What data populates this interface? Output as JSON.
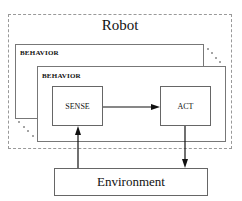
{
  "diagram": {
    "robot": {
      "title": "Robot"
    },
    "behaviors": [
      {
        "label": "BEHAVIOR"
      },
      {
        "label": "BEHAVIOR"
      }
    ],
    "nodes": {
      "sense": "SENSE",
      "act": "ACT",
      "environment": "Environment"
    },
    "edges": [
      {
        "from": "SENSE",
        "to": "ACT"
      },
      {
        "from": "ACT",
        "to": "Environment"
      },
      {
        "from": "Environment",
        "to": "SENSE"
      }
    ],
    "colors": {
      "line": "#111111",
      "robot_border": "#999999",
      "box_border": "#666666"
    }
  }
}
